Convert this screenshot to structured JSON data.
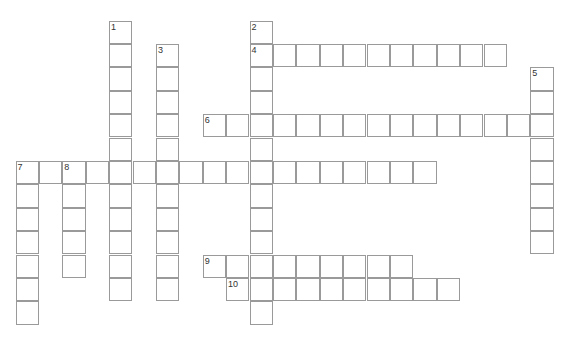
{
  "puzzle": {
    "type": "crossword",
    "grid": {
      "origin_x": 15.5,
      "origin_y": 20.5,
      "cell_size": 23.4,
      "border_color": "#9a9a9a",
      "background": "#ffffff"
    },
    "words": [
      {
        "number": "1",
        "direction": "down",
        "row": 0,
        "col": 4,
        "length": 12
      },
      {
        "number": "2",
        "direction": "down",
        "row": 0,
        "col": 10,
        "length": 13
      },
      {
        "number": "3",
        "direction": "down",
        "row": 1,
        "col": 6,
        "length": 11
      },
      {
        "number": "4",
        "direction": "across",
        "row": 1,
        "col": 10,
        "length": 11
      },
      {
        "number": "5",
        "direction": "down",
        "row": 2,
        "col": 22,
        "length": 8
      },
      {
        "number": "6",
        "direction": "across",
        "row": 4,
        "col": 8,
        "length": 15
      },
      {
        "number": "7",
        "direction": "down",
        "row": 6,
        "col": 0,
        "length": 7
      },
      {
        "number": "7",
        "direction": "across",
        "row": 6,
        "col": 0,
        "length": 18
      },
      {
        "number": "8",
        "direction": "down",
        "row": 6,
        "col": 2,
        "length": 5
      },
      {
        "number": "9",
        "direction": "across",
        "row": 10,
        "col": 8,
        "length": 9
      },
      {
        "number": "10",
        "direction": "across",
        "row": 11,
        "col": 9,
        "length": 10
      }
    ]
  }
}
